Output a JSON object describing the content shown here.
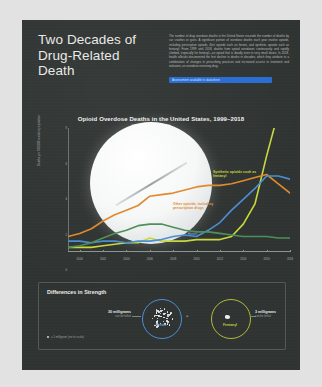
{
  "poster": {
    "title": "Two Decades of Drug-Related Death",
    "intro": "The number of drug overdose deaths in the United States exceeds the number of deaths by car crashes or guns. A significant portion of overdose deaths each year involve opioids, including prescription opioids, illicit opioids such as heroin, and synthetic opioids such as fentanyl. From 1999 until 2018, deaths from opioid overdoses continuously and rapidly climbed, especially for fentanyl—an opioid that is deadly even in very small doses. In 2018, health officials documented the first decline in deaths in decades, which they attribute to a combination of changes in prescribing practices and increased access to treatment and naloxone, an overdose-reversing drug.",
    "selected_link": "Assessment available in datasheet"
  },
  "chart_data": {
    "type": "line",
    "title": "Opioid Overdose Deaths in the United States, 1999–2018",
    "xlabel": "",
    "ylabel": "Deaths per 100,000 resident population",
    "xlim": [
      1999,
      2018
    ],
    "ylim": [
      0,
      8
    ],
    "yticks": [
      0,
      2,
      4,
      6,
      8
    ],
    "xticks": [
      2000,
      2002,
      2004,
      2006,
      2008,
      2010,
      2012,
      2014,
      2016,
      2018
    ],
    "grid": false,
    "legend_position": "inline-annotations",
    "x": [
      1999,
      2000,
      2001,
      2002,
      2003,
      2004,
      2005,
      2006,
      2007,
      2008,
      2009,
      2010,
      2011,
      2012,
      2013,
      2014,
      2015,
      2016,
      2017,
      2018
    ],
    "series": [
      {
        "name": "Synthetic opioids such as fentanyl",
        "color": "#c9d93c",
        "values": [
          0.3,
          0.3,
          0.3,
          0.4,
          0.5,
          0.6,
          0.6,
          0.9,
          0.7,
          0.7,
          0.7,
          0.8,
          0.8,
          0.8,
          1.0,
          1.8,
          3.1,
          6.2,
          9.0,
          9.9
        ]
      },
      {
        "name": "Other opioids, including prescription drugs",
        "color": "#e08a2e",
        "values": [
          1.0,
          1.2,
          1.5,
          2.0,
          2.4,
          2.7,
          3.0,
          3.6,
          3.7,
          3.8,
          4.0,
          4.2,
          4.3,
          4.3,
          4.4,
          4.6,
          4.8,
          5.0,
          4.4,
          3.8
        ]
      },
      {
        "name": "Heroin",
        "color": "#4a8fd4",
        "values": [
          0.7,
          0.7,
          0.6,
          0.7,
          0.7,
          0.6,
          0.7,
          0.7,
          0.8,
          1.0,
          1.1,
          1.0,
          1.4,
          1.9,
          2.7,
          3.4,
          4.1,
          4.9,
          4.9,
          4.7
        ]
      },
      {
        "name": "Methadone",
        "color": "#4f8f5a",
        "values": [
          0.3,
          0.4,
          0.6,
          0.9,
          1.2,
          1.4,
          1.7,
          1.8,
          1.8,
          1.6,
          1.4,
          1.3,
          1.3,
          1.2,
          1.1,
          1.0,
          1.0,
          1.0,
          0.9,
          0.9
        ]
      }
    ],
    "annotations": [
      {
        "text": "Synthetic opioids such as fentanyl",
        "series": "Synthetic opioids such as fentanyl"
      },
      {
        "text": "Other opioids, including prescription drugs",
        "series": "Other opioids, including prescription drugs"
      },
      {
        "text": "Heroin",
        "series": "Heroin"
      }
    ]
  },
  "strength": {
    "title": "Differences in Strength",
    "heroin": {
      "caption": "Heroin",
      "amount": "30 milligrams",
      "note": "can be lethal"
    },
    "fentanyl": {
      "caption": "Fentanyl",
      "amount": "3 milligrams",
      "note": "can be lethal"
    },
    "equals": "=",
    "footnote": "= 1 milligram (not to scale)"
  }
}
